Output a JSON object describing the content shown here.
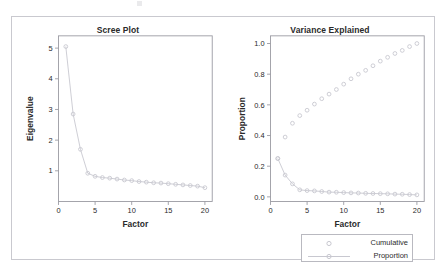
{
  "figure": {
    "background_color": "#ffffff",
    "frame_border_color": "#c9c9cf",
    "series_color": "#c8c8d0",
    "axis_color": "#9a9aa2",
    "text_color": "#2a2a2a"
  },
  "panels": {
    "left": {
      "title": "Scree Plot",
      "xlabel": "Factor",
      "ylabel": "Eigenvalue"
    },
    "right": {
      "title": "Variance Explained",
      "xlabel": "Factor",
      "ylabel": "Proportion"
    }
  },
  "legend": {
    "position": "below-right-panel",
    "entries": [
      {
        "label": "Cumulative",
        "marker": "circle-open",
        "line": false
      },
      {
        "label": "Proportion",
        "marker": "circle-open",
        "line": true
      }
    ]
  },
  "chart_data": [
    {
      "type": "line",
      "id": "scree-plot",
      "title": "Scree Plot",
      "xlabel": "Factor",
      "ylabel": "Eigenvalue",
      "xlim": [
        0,
        21
      ],
      "ylim": [
        0,
        5.4
      ],
      "xticks": [
        0,
        5,
        10,
        15,
        20
      ],
      "yticks": [
        1,
        2,
        3,
        4,
        5
      ],
      "xticklabels": [
        "0",
        "5",
        "10",
        "15",
        "20"
      ],
      "yticklabels": [
        "1",
        "2",
        "3",
        "4",
        "5"
      ],
      "grid": false,
      "legend": false,
      "marker": "circle-open",
      "line_style": "solid",
      "color": "#c8c8d0",
      "x": [
        1,
        2,
        3,
        4,
        5,
        6,
        7,
        8,
        9,
        10,
        11,
        12,
        13,
        14,
        15,
        16,
        17,
        18,
        19,
        20
      ],
      "series": [
        {
          "name": "Eigenvalue",
          "values": [
            5.05,
            2.85,
            1.7,
            0.92,
            0.82,
            0.78,
            0.76,
            0.73,
            0.7,
            0.68,
            0.65,
            0.63,
            0.61,
            0.6,
            0.58,
            0.56,
            0.54,
            0.52,
            0.5,
            0.45
          ]
        }
      ]
    },
    {
      "type": "line",
      "id": "variance-explained",
      "title": "Variance Explained",
      "xlabel": "Factor",
      "ylabel": "Proportion",
      "xlim": [
        0,
        21
      ],
      "ylim": [
        -0.03,
        1.05
      ],
      "xticks": [
        0,
        5,
        10,
        15,
        20
      ],
      "yticks": [
        0.0,
        0.2,
        0.4,
        0.6,
        0.8,
        1.0
      ],
      "xticklabels": [
        "0",
        "5",
        "10",
        "15",
        "20"
      ],
      "yticklabels": [
        "0.0",
        "0.2",
        "0.4",
        "0.6",
        "0.8",
        "1.0"
      ],
      "grid": false,
      "legend": true,
      "color": "#c8c8d0",
      "x": [
        1,
        2,
        3,
        4,
        5,
        6,
        7,
        8,
        9,
        10,
        11,
        12,
        13,
        14,
        15,
        16,
        17,
        18,
        19,
        20
      ],
      "series": [
        {
          "name": "Cumulative",
          "marker": "circle-open",
          "line": false,
          "values": [
            0.25,
            0.39,
            0.48,
            0.53,
            0.565,
            0.605,
            0.64,
            0.67,
            0.7,
            0.735,
            0.77,
            0.8,
            0.825,
            0.855,
            0.885,
            0.91,
            0.935,
            0.955,
            0.98,
            1.0
          ]
        },
        {
          "name": "Proportion",
          "marker": "circle-open",
          "line": true,
          "values": [
            0.25,
            0.142,
            0.085,
            0.046,
            0.041,
            0.039,
            0.035,
            0.031,
            0.03,
            0.028,
            0.026,
            0.025,
            0.023,
            0.022,
            0.021,
            0.02,
            0.018,
            0.017,
            0.015,
            0.013
          ]
        }
      ]
    }
  ]
}
